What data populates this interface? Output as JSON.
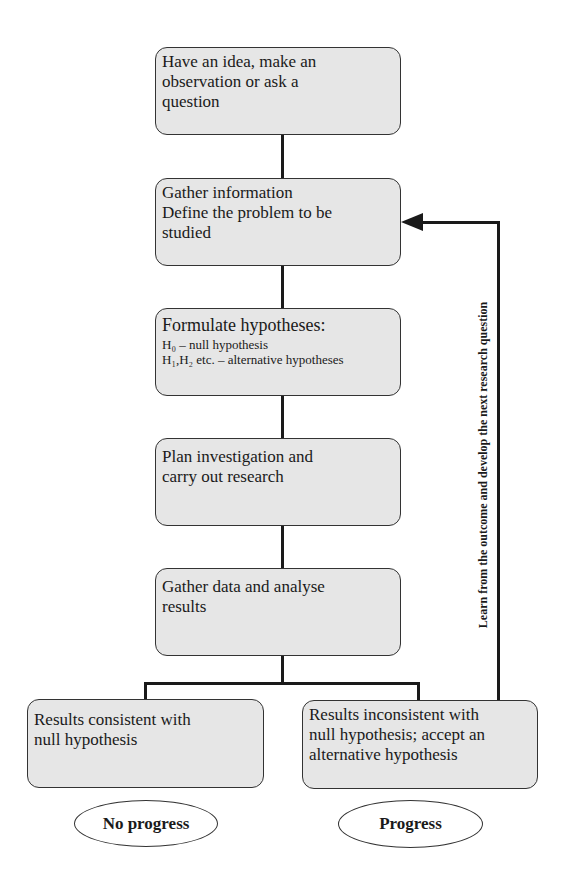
{
  "diagram": {
    "steps": [
      {
        "lines": [
          "Have an idea, make an",
          "observation or ask a",
          "question"
        ]
      },
      {
        "lines": [
          "Gather information",
          "Define the problem to be",
          "studied"
        ]
      },
      {
        "title": "Formulate hypotheses:",
        "h0": "H₀ – null hypothesis",
        "h1": "H₁,H₂ etc. – alternative hypotheses"
      },
      {
        "lines": [
          "Plan investigation and",
          "carry out research"
        ]
      },
      {
        "lines": [
          "Gather data and analyse",
          "results"
        ]
      }
    ],
    "outcomes": [
      {
        "lines": [
          "Results consistent with",
          "null hypothesis"
        ],
        "result": "No progress"
      },
      {
        "lines": [
          "Results inconsistent with",
          "null hypothesis; accept an",
          "alternative hypothesis"
        ],
        "result": "Progress"
      }
    ],
    "feedback_label": "Learn from the outcome and develop the next research question"
  }
}
